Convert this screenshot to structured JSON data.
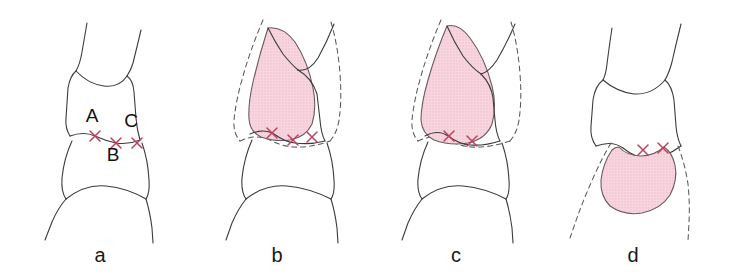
{
  "figure": {
    "background_color": "#ffffff",
    "outline_color": "#3c3c3c",
    "dashed_outline_color": "#5a5a5a",
    "lesion_fill_color": "#f4cdd9",
    "lesion_stipple_color": "#e8a9bb",
    "lesion_stroke_color": "#6a5a5e",
    "marker_color": "#bf3f5f",
    "label_color": "#111111"
  },
  "panels": [
    {
      "id": "panel-a",
      "caption": "a",
      "caption_x": 100,
      "caption_y": 262,
      "has_lesion": false,
      "has_dashed_outline": false,
      "marker_count": 3,
      "structure_labels": [
        {
          "text": "A",
          "x": 92,
          "y": 122
        },
        {
          "text": "B",
          "x": 113,
          "y": 161
        },
        {
          "text": "C",
          "x": 131,
          "y": 127
        }
      ]
    },
    {
      "id": "panel-b",
      "caption": "b",
      "caption_x": 277,
      "caption_y": 262,
      "has_lesion": true,
      "has_dashed_outline": true,
      "marker_count": 3,
      "structure_labels": []
    },
    {
      "id": "panel-c",
      "caption": "c",
      "caption_x": 456,
      "caption_y": 262,
      "has_lesion": true,
      "has_dashed_outline": true,
      "marker_count": 2,
      "structure_labels": []
    },
    {
      "id": "panel-d",
      "caption": "d",
      "caption_x": 633,
      "caption_y": 262,
      "has_lesion": true,
      "has_dashed_outline": true,
      "marker_count": 2,
      "structure_labels": []
    }
  ],
  "markers": {
    "panel_a": [
      {
        "name": "marker-a",
        "x": 95,
        "y": 136
      },
      {
        "name": "marker-b",
        "x": 116,
        "y": 143
      },
      {
        "name": "marker-c",
        "x": 137,
        "y": 143
      }
    ],
    "panel_b": [
      {
        "name": "marker-a",
        "x": 272,
        "y": 133
      },
      {
        "name": "marker-b",
        "x": 293,
        "y": 140
      },
      {
        "name": "marker-c",
        "x": 312,
        "y": 137
      }
    ],
    "panel_c": [
      {
        "name": "marker-a",
        "x": 449,
        "y": 136
      },
      {
        "name": "marker-b",
        "x": 472,
        "y": 141
      }
    ],
    "panel_d": [
      {
        "name": "marker-a",
        "x": 643,
        "y": 150
      },
      {
        "name": "marker-b",
        "x": 663,
        "y": 148
      }
    ]
  }
}
